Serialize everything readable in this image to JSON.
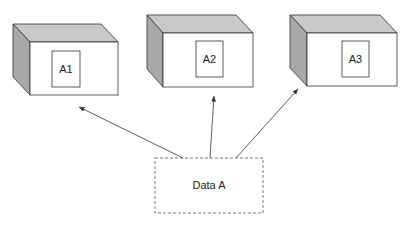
{
  "diagram": {
    "boxes": [
      {
        "label": "A1"
      },
      {
        "label": "A2"
      },
      {
        "label": "A3"
      }
    ],
    "source": {
      "label": "Data A"
    },
    "colors": {
      "stroke": "#333333",
      "top_face": "#c8c8c8",
      "side_face": "#a8a8a8",
      "front_face": "#ffffff"
    }
  }
}
